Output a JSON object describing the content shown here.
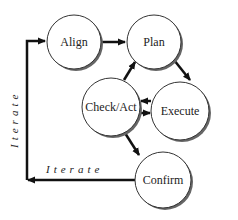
{
  "diagram": {
    "nodes": [
      {
        "id": "align",
        "label": "Align"
      },
      {
        "id": "plan",
        "label": "Plan"
      },
      {
        "id": "check_act",
        "label": "Check/Act"
      },
      {
        "id": "execute",
        "label": "Execute"
      },
      {
        "id": "confirm",
        "label": "Confirm"
      }
    ],
    "edges": [
      {
        "from": "align",
        "to": "plan"
      },
      {
        "from": "plan",
        "to": "execute"
      },
      {
        "from": "execute",
        "to": "check_act"
      },
      {
        "from": "check_act",
        "to": "execute"
      },
      {
        "from": "check_act",
        "to": "plan"
      },
      {
        "from": "check_act",
        "to": "confirm"
      },
      {
        "from": "confirm",
        "to": "align",
        "label": "Iterate"
      }
    ],
    "iterate_horizontal_label": "Iterate",
    "iterate_vertical_label": "Iterate"
  }
}
